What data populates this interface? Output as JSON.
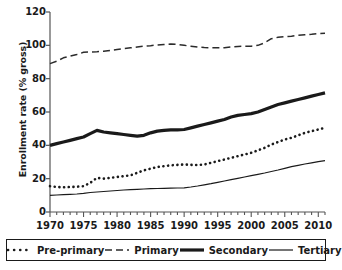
{
  "chart_data": {
    "type": "line",
    "title": "",
    "xlabel": "",
    "ylabel": "Enrollment rate (% gross)",
    "xlim": [
      1970,
      2011
    ],
    "ylim": [
      0,
      120
    ],
    "grid": false,
    "legend_position": "bottom",
    "y_ticks": [
      0,
      20,
      40,
      60,
      80,
      100,
      120
    ],
    "y_tick_labels": [
      "0",
      "20",
      "40",
      "60",
      "80",
      "100",
      "120"
    ],
    "x_ticks": [
      1970,
      1975,
      1980,
      1985,
      1990,
      1995,
      2000,
      2005,
      2010
    ],
    "x_tick_labels": [
      "1970",
      "1975",
      "1980",
      "1985",
      "1990",
      "1995",
      "2000",
      "2005",
      "2010"
    ],
    "x_minor_tick_step": 1,
    "x": [
      1970,
      1971,
      1972,
      1973,
      1974,
      1975,
      1976,
      1977,
      1978,
      1979,
      1980,
      1981,
      1982,
      1983,
      1984,
      1985,
      1986,
      1987,
      1988,
      1989,
      1990,
      1991,
      1992,
      1993,
      1994,
      1995,
      1996,
      1997,
      1998,
      1999,
      2000,
      2001,
      2002,
      2003,
      2004,
      2005,
      2006,
      2007,
      2008,
      2009,
      2010,
      2011
    ],
    "series": [
      {
        "name": "Pre-primary",
        "style": "dotted",
        "color": "#1a1a1a",
        "values": [
          15.5,
          15.0,
          14.8,
          15.0,
          15.2,
          15.5,
          17.5,
          20.5,
          20.0,
          20.5,
          21.0,
          21.5,
          22.0,
          23.5,
          25.0,
          26.0,
          27.0,
          27.5,
          28.0,
          28.3,
          28.5,
          28.3,
          28.2,
          28.5,
          29.5,
          30.5,
          31.5,
          32.5,
          33.5,
          34.5,
          35.5,
          37.0,
          38.5,
          40.5,
          42.0,
          43.5,
          44.5,
          46.0,
          47.5,
          48.5,
          49.5,
          50.5
        ]
      },
      {
        "name": "Primary",
        "style": "dashed",
        "color": "#2b2b2b",
        "values": [
          89.0,
          90.5,
          92.5,
          93.5,
          94.5,
          95.8,
          96.0,
          96.2,
          96.5,
          97.0,
          97.5,
          98.0,
          98.5,
          99.0,
          99.5,
          99.8,
          100.2,
          100.5,
          100.8,
          100.5,
          100.0,
          99.5,
          99.0,
          98.7,
          98.5,
          98.6,
          98.6,
          99.0,
          99.3,
          99.5,
          99.5,
          100.0,
          101.5,
          104.0,
          104.8,
          105.2,
          105.5,
          106.0,
          106.3,
          106.6,
          107.0,
          107.2
        ]
      },
      {
        "name": "Secondary",
        "style": "thick",
        "color": "#1a1a1a",
        "values": [
          40.0,
          41.0,
          42.0,
          43.0,
          44.0,
          45.0,
          47.0,
          49.0,
          48.0,
          47.5,
          47.0,
          46.5,
          46.0,
          45.5,
          46.0,
          47.5,
          48.5,
          49.0,
          49.3,
          49.3,
          49.5,
          50.5,
          51.5,
          52.5,
          53.5,
          54.5,
          55.5,
          57.0,
          58.0,
          58.5,
          59.0,
          60.0,
          61.5,
          63.0,
          64.5,
          65.5,
          66.5,
          67.5,
          68.5,
          69.5,
          70.5,
          71.5
        ]
      },
      {
        "name": "Tertiary",
        "style": "thin",
        "color": "#1a1a1a",
        "values": [
          10.0,
          10.2,
          10.4,
          10.6,
          10.8,
          11.2,
          11.7,
          12.0,
          12.3,
          12.6,
          12.9,
          13.2,
          13.4,
          13.6,
          13.8,
          14.0,
          14.1,
          14.2,
          14.3,
          14.4,
          14.5,
          15.0,
          15.6,
          16.3,
          17.0,
          17.8,
          18.6,
          19.4,
          20.2,
          21.0,
          21.8,
          22.6,
          23.4,
          24.3,
          25.2,
          26.2,
          27.2,
          28.0,
          28.8,
          29.5,
          30.2,
          30.8
        ]
      }
    ]
  },
  "legend": {
    "items": [
      {
        "label": "Pre-primary",
        "swatch": "dotted-line-swatch"
      },
      {
        "label": "Primary",
        "swatch": "dashed-line-swatch"
      },
      {
        "label": "Secondary",
        "swatch": "thick-line-swatch"
      },
      {
        "label": "Tertiary",
        "swatch": "thin-line-swatch"
      }
    ]
  }
}
